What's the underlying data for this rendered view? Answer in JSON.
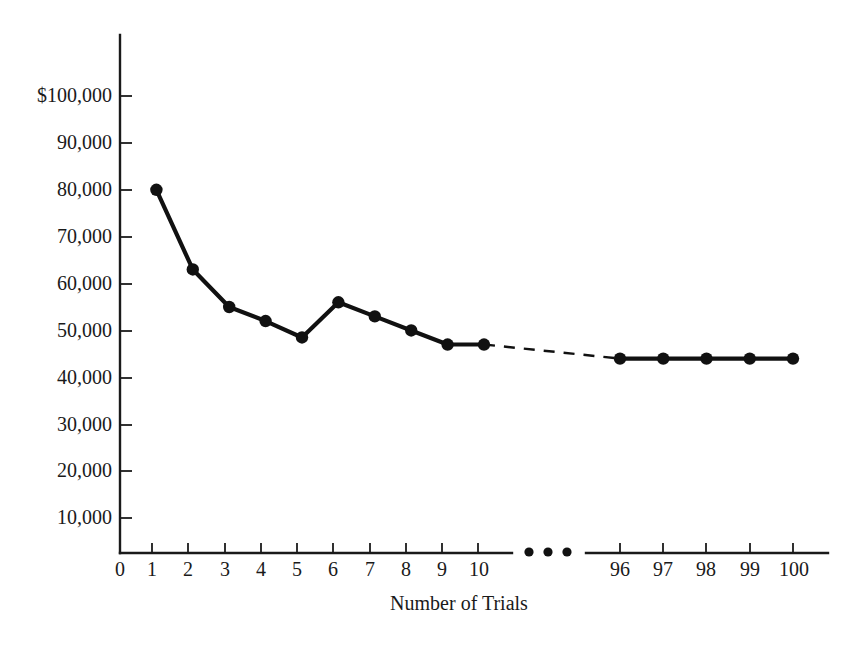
{
  "chart_data": {
    "type": "line",
    "title": "",
    "subtitle": "",
    "xlabel": "Number of Trials",
    "ylabel": "",
    "grid": false,
    "legend": null,
    "currency_symbol": "$",
    "axis_break": {
      "present": true,
      "marker": "...",
      "between": [
        10,
        96
      ]
    },
    "ylim": [
      0,
      100000
    ],
    "ytick_values": [
      10000,
      20000,
      30000,
      40000,
      50000,
      60000,
      70000,
      80000,
      90000,
      100000
    ],
    "ytick_labels": [
      "10,000",
      "20,000",
      "30,000",
      "40,000",
      "50,000",
      "60,000",
      "70,000",
      "80,000",
      "90,000",
      "$100,000"
    ],
    "xtick_labels_left": [
      "0",
      "1",
      "2",
      "3",
      "4",
      "5",
      "6",
      "7",
      "8",
      "9",
      "10"
    ],
    "xtick_labels_right": [
      "96",
      "97",
      "98",
      "99",
      "100"
    ],
    "x": [
      1,
      2,
      3,
      4,
      5,
      6,
      7,
      8,
      9,
      10,
      96,
      97,
      98,
      99,
      100
    ],
    "values": [
      80000,
      63000,
      55000,
      52000,
      48500,
      56000,
      53000,
      50000,
      47000,
      47000,
      44000,
      44000,
      44000,
      44000,
      44000
    ],
    "series": [
      {
        "name": "Average cost per trial",
        "segments": [
          {
            "style": "solid",
            "x": [
              1,
              2,
              3,
              4,
              5,
              6,
              7,
              8,
              9,
              10
            ],
            "values": [
              80000,
              63000,
              55000,
              52000,
              48500,
              56000,
              53000,
              50000,
              47000,
              47000
            ]
          },
          {
            "style": "dashed",
            "x": [
              10,
              96
            ],
            "values": [
              47000,
              44000
            ]
          },
          {
            "style": "solid",
            "x": [
              96,
              97,
              98,
              99,
              100
            ],
            "values": [
              44000,
              44000,
              44000,
              44000,
              44000
            ]
          }
        ]
      }
    ],
    "colors": {
      "line": "#111111",
      "marker": "#111111",
      "axis": "#1a1a1a",
      "background": "#ffffff"
    }
  }
}
